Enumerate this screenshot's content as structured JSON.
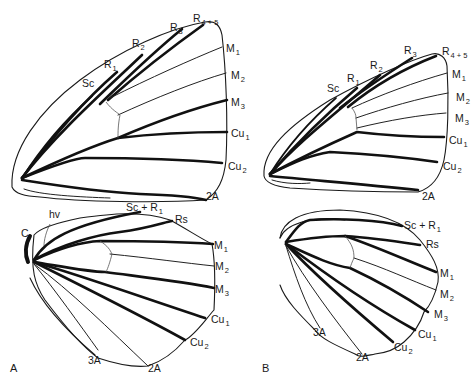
{
  "figure": {
    "panels": [
      {
        "id": "A",
        "panel_label": "A",
        "panel_label_pos": [
          10,
          372
        ],
        "forewing": {
          "labels": [
            {
              "base": "Sc",
              "sub": "",
              "x": 82,
              "y": 87
            },
            {
              "base": "R",
              "sub": "1",
              "x": 104,
              "y": 68
            },
            {
              "base": "R",
              "sub": "2",
              "x": 132,
              "y": 47
            },
            {
              "base": "R",
              "sub": "3",
              "x": 170,
              "y": 31
            },
            {
              "base": "R",
              "sub": "4 + 5",
              "x": 193,
              "y": 22
            },
            {
              "base": "M",
              "sub": "1",
              "x": 226,
              "y": 52
            },
            {
              "base": "M",
              "sub": "2",
              "x": 231,
              "y": 79
            },
            {
              "base": "M",
              "sub": "3",
              "x": 231,
              "y": 106
            },
            {
              "base": "Cu",
              "sub": "1",
              "x": 231,
              "y": 137
            },
            {
              "base": "Cu",
              "sub": "2",
              "x": 228,
              "y": 170
            },
            {
              "base": "2A",
              "sub": "",
              "x": 206,
              "y": 200
            }
          ]
        },
        "hindwing": {
          "labels": [
            {
              "base": "C",
              "sub": "",
              "x": 21,
              "y": 237
            },
            {
              "base": "hv",
              "sub": "",
              "x": 49,
              "y": 218
            },
            {
              "base": "Sc + R",
              "sub": "1",
              "x": 126,
              "y": 211
            },
            {
              "base": "Rs",
              "sub": "",
              "x": 175,
              "y": 223
            },
            {
              "base": "M",
              "sub": "1",
              "x": 214,
              "y": 249
            },
            {
              "base": "M",
              "sub": "2",
              "x": 215,
              "y": 270
            },
            {
              "base": "M",
              "sub": "3",
              "x": 215,
              "y": 293
            },
            {
              "base": "Cu",
              "sub": "1",
              "x": 211,
              "y": 323
            },
            {
              "base": "Cu",
              "sub": "2",
              "x": 190,
              "y": 346
            },
            {
              "base": "3A",
              "sub": "",
              "x": 88,
              "y": 364
            },
            {
              "base": "2A",
              "sub": "",
              "x": 148,
              "y": 372
            }
          ]
        }
      },
      {
        "id": "B",
        "panel_label": "B",
        "panel_label_pos": [
          262,
          372
        ],
        "forewing": {
          "labels": [
            {
              "base": "Sc",
              "sub": "",
              "x": 327,
              "y": 92
            },
            {
              "base": "R",
              "sub": "1",
              "x": 347,
              "y": 82
            },
            {
              "base": "R",
              "sub": "2",
              "x": 370,
              "y": 69
            },
            {
              "base": "R",
              "sub": "3",
              "x": 404,
              "y": 54
            },
            {
              "base": "R",
              "sub": "4 + 5",
              "x": 442,
              "y": 55
            },
            {
              "base": "M",
              "sub": "1",
              "x": 452,
              "y": 78
            },
            {
              "base": "M",
              "sub": "2",
              "x": 456,
              "y": 101
            },
            {
              "base": "M",
              "sub": "3",
              "x": 455,
              "y": 122
            },
            {
              "base": "Cu",
              "sub": "1",
              "x": 449,
              "y": 144
            },
            {
              "base": "Cu",
              "sub": "2",
              "x": 443,
              "y": 170
            },
            {
              "base": "2A",
              "sub": "",
              "x": 422,
              "y": 200
            }
          ]
        },
        "hindwing": {
          "labels": [
            {
              "base": "Sc + R",
              "sub": "1",
              "x": 404,
              "y": 229
            },
            {
              "base": "Rs",
              "sub": "",
              "x": 426,
              "y": 248
            },
            {
              "base": "M",
              "sub": "1",
              "x": 440,
              "y": 277
            },
            {
              "base": "M",
              "sub": "2",
              "x": 440,
              "y": 298
            },
            {
              "base": "M",
              "sub": "3",
              "x": 434,
              "y": 318
            },
            {
              "base": "Cu",
              "sub": "1",
              "x": 418,
              "y": 338
            },
            {
              "base": "Cu",
              "sub": "2",
              "x": 394,
              "y": 351
            },
            {
              "base": "3A",
              "sub": "",
              "x": 313,
              "y": 336
            },
            {
              "base": "2A",
              "sub": "",
              "x": 356,
              "y": 361
            }
          ]
        }
      }
    ]
  }
}
